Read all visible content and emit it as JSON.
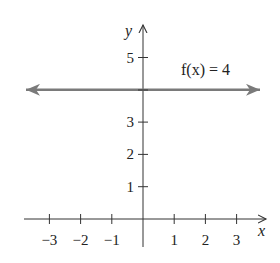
{
  "chart_data": {
    "type": "line",
    "title": "",
    "function_label": "f(x) = 4",
    "xlabel": "x",
    "ylabel": "y",
    "xlim": [
      -3.8,
      3.9
    ],
    "ylim": [
      -0.9,
      6.0
    ],
    "x_ticks": [
      -3,
      -2,
      -1,
      1,
      2,
      3
    ],
    "x_tick_labels": [
      "−3",
      "−2",
      "−1",
      "1",
      "2",
      "3"
    ],
    "y_ticks": [
      1,
      2,
      3,
      5
    ],
    "y_tick_labels": [
      "1",
      "2",
      "3",
      "5"
    ],
    "grid": false,
    "series": [
      {
        "name": "f(x) = 4",
        "x": [
          -3.7,
          3.6
        ],
        "y": [
          4,
          4
        ],
        "color": "#7a7a7a",
        "arrows": "both"
      }
    ]
  },
  "colors": {
    "axis": "#333333",
    "line": "#7a7a7a",
    "text": "#222222"
  }
}
